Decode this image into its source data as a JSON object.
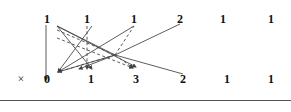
{
  "figure": {
    "width": 291,
    "height": 112,
    "background": "#ffffff",
    "line_color": "#4a4a4a",
    "text_color": "#111111",
    "rule_color": "#555555",
    "rule_y": 100
  },
  "row_marker": {
    "label": "×",
    "x": 21,
    "y": 72
  },
  "top_row": {
    "name": "source-counts-row",
    "tokens": [
      {
        "label": "1",
        "x": 47
      },
      {
        "label": "1",
        "x": 87
      },
      {
        "label": "1",
        "x": 134
      },
      {
        "label": "2",
        "x": 180
      },
      {
        "label": "1",
        "x": 223
      },
      {
        "label": "1",
        "x": 271
      }
    ]
  },
  "bottom_row": {
    "name": "target-counts-row",
    "tokens": [
      {
        "label": "0",
        "x": 47
      },
      {
        "label": "1",
        "x": 91
      },
      {
        "label": "3",
        "x": 136
      },
      {
        "label": "2",
        "x": 183
      },
      {
        "label": "1",
        "x": 227
      },
      {
        "label": "1",
        "x": 271
      }
    ]
  },
  "edges": [
    {
      "name": "edge-vertical-1-to-0",
      "x1": 46,
      "y1": 25,
      "x2": 46,
      "y2": 80,
      "style": "solid",
      "arrow": true
    },
    {
      "name": "edge-solid-a",
      "x1": 57,
      "y1": 26,
      "x2": 92,
      "y2": 69,
      "style": "solid",
      "arrow": true
    },
    {
      "name": "edge-solid-b",
      "x1": 57,
      "y1": 26,
      "x2": 136,
      "y2": 67,
      "style": "solid",
      "arrow": true
    },
    {
      "name": "edge-solid-c",
      "x1": 92,
      "y1": 26,
      "x2": 58,
      "y2": 72,
      "style": "solid",
      "arrow": true
    },
    {
      "name": "edge-solid-d",
      "x1": 134,
      "y1": 26,
      "x2": 58,
      "y2": 72,
      "style": "solid",
      "arrow": true
    },
    {
      "name": "edge-solid-e",
      "x1": 115,
      "y1": 55,
      "x2": 180,
      "y2": 24,
      "style": "solid",
      "arrow": false
    },
    {
      "name": "edge-solid-f",
      "x1": 115,
      "y1": 55,
      "x2": 183,
      "y2": 74,
      "style": "solid",
      "arrow": false
    },
    {
      "name": "edge-solid-g",
      "x1": 57,
      "y1": 26,
      "x2": 115,
      "y2": 55,
      "style": "solid",
      "arrow": false
    },
    {
      "name": "edge-solid-h",
      "x1": 115,
      "y1": 55,
      "x2": 79,
      "y2": 69,
      "style": "solid",
      "arrow": true
    },
    {
      "name": "edge-solid-i",
      "x1": 115,
      "y1": 55,
      "x2": 58,
      "y2": 72,
      "style": "solid",
      "arrow": true
    },
    {
      "name": "edge-dashed-vertical",
      "x1": 87,
      "y1": 26,
      "x2": 87,
      "y2": 69,
      "style": "dashed",
      "arrow": true
    },
    {
      "name": "edge-dashed-a",
      "x1": 57,
      "y1": 30,
      "x2": 115,
      "y2": 55,
      "style": "dashed",
      "arrow": false
    },
    {
      "name": "edge-dashed-b",
      "x1": 115,
      "y1": 55,
      "x2": 134,
      "y2": 26,
      "style": "dashed",
      "arrow": false
    },
    {
      "name": "edge-dashed-c",
      "x1": 115,
      "y1": 55,
      "x2": 133,
      "y2": 68,
      "style": "dashed",
      "arrow": true
    },
    {
      "name": "edge-dashed-d",
      "x1": 115,
      "y1": 55,
      "x2": 58,
      "y2": 72,
      "style": "dashed",
      "arrow": false
    },
    {
      "name": "edge-dashed-e",
      "x1": 57,
      "y1": 38,
      "x2": 133,
      "y2": 68,
      "style": "dashed",
      "arrow": true
    }
  ]
}
